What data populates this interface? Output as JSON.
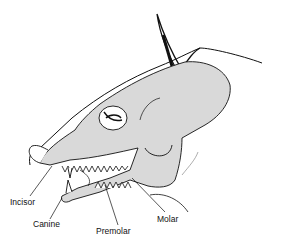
{
  "diagram": {
    "colors": {
      "bone_fill": "#d9d9d9",
      "outline": "#111111",
      "background": "#ffffff"
    },
    "labels": [
      {
        "id": "incisor",
        "text": "Incisor",
        "x": 10,
        "y": 198
      },
      {
        "id": "canine",
        "text": "Canine",
        "x": 33,
        "y": 220
      },
      {
        "id": "premolar",
        "text": "Premolar",
        "x": 96,
        "y": 227
      },
      {
        "id": "molar",
        "text": "Molar",
        "x": 157,
        "y": 215
      }
    ]
  }
}
